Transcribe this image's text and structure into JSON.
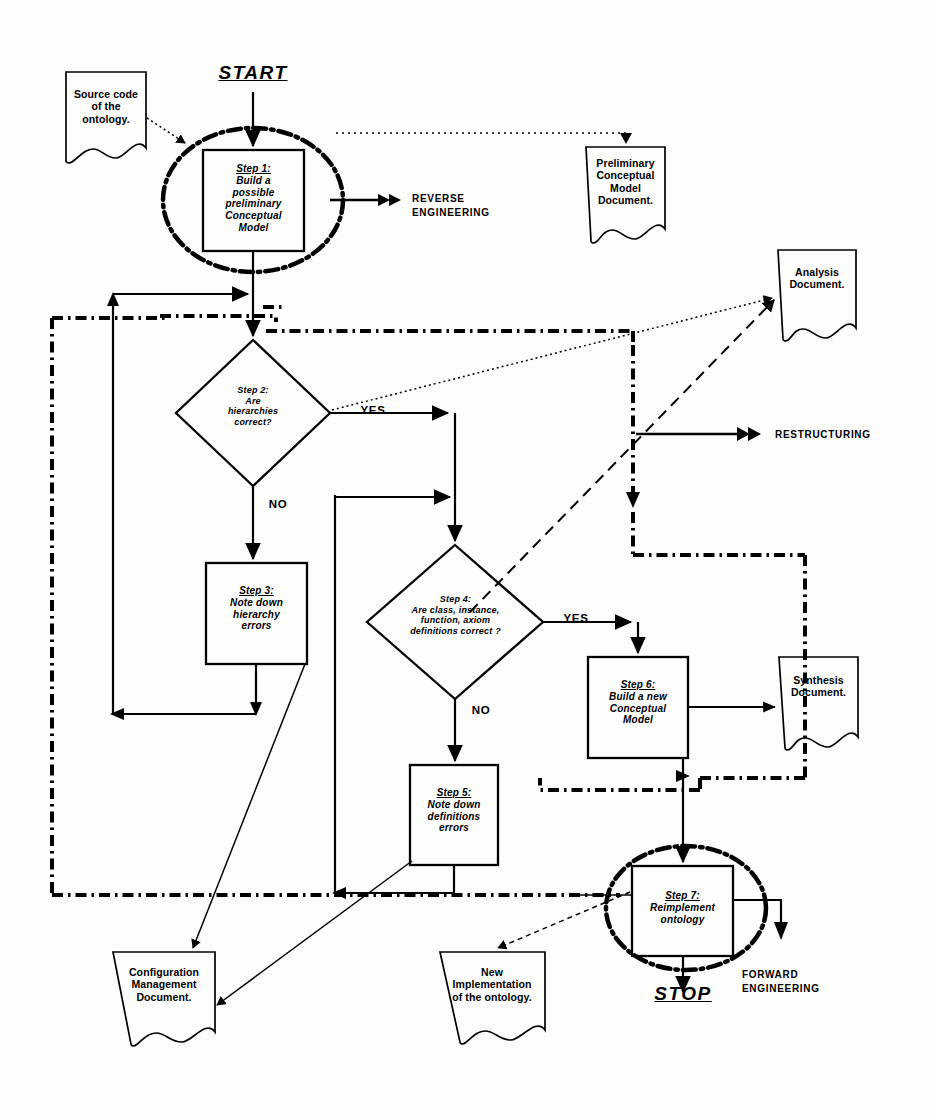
{
  "diagram": {
    "start_label": "START",
    "stop_label": "STOP",
    "phases": [
      {
        "id": "reverse",
        "line1": "REVERSE",
        "line2": "ENGINEERING"
      },
      {
        "id": "restructuring",
        "line1": "RESTRUCTURING",
        "line2": ""
      },
      {
        "id": "forward",
        "line1": "FORWARD",
        "line2": "ENGINEERING"
      }
    ],
    "steps": [
      {
        "id": "step1",
        "heading": "Step 1:",
        "body": "Build a\npossible\npreliminary\nConceptual\nModel"
      },
      {
        "id": "step3",
        "heading": "Step 3:",
        "body": "Note down\nhierarchy\nerrors"
      },
      {
        "id": "step5",
        "heading": "Step 5:",
        "body": "Note down\ndefinitions\nerrors"
      },
      {
        "id": "step6",
        "heading": "Step 6:",
        "body": "Build a new\nConceptual\nModel"
      },
      {
        "id": "step7",
        "heading": "Step 7:",
        "body": "Reimplement\nontology"
      }
    ],
    "decisions": [
      {
        "id": "step2",
        "heading": "Step 2:",
        "body": "Are\nhierarchies\ncorrect?"
      },
      {
        "id": "step4",
        "heading": "Step 4:",
        "body": "Are class, instance,\nfunction, axiom\ndefinitions correct ?"
      }
    ],
    "documents": [
      {
        "id": "source-code",
        "text": "Source code\nof  the\nontology."
      },
      {
        "id": "preliminary",
        "text": "Preliminary\nConceptual\nModel\nDocument."
      },
      {
        "id": "analysis",
        "text": "Analysis\nDocument."
      },
      {
        "id": "synthesis",
        "text": "Synthesis\nDocument."
      },
      {
        "id": "configuration",
        "text": "Configuration\nManagement\nDocument."
      },
      {
        "id": "new-impl",
        "text": "New\nImplementation\nof  the ontology."
      }
    ],
    "branch_labels": [
      {
        "id": "step2-yes",
        "text": "YES"
      },
      {
        "id": "step2-no",
        "text": "NO"
      },
      {
        "id": "step4-yes",
        "text": "YES"
      },
      {
        "id": "step4-no",
        "text": "NO"
      }
    ],
    "colors": {
      "ink": "#000000",
      "paper": "#fdfdfc"
    }
  }
}
